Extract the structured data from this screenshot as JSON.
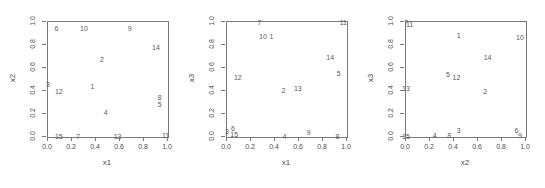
{
  "figure": {
    "type": "scatterplot-matrix-row",
    "panel_count": 3,
    "axis_ticks": [
      "0.0",
      "0.2",
      "0.4",
      "0.6",
      "0.8",
      "1.0"
    ],
    "tick_values": [
      0.0,
      0.2,
      0.4,
      0.6,
      0.8,
      1.0
    ],
    "point_color": "#595959",
    "frame_color": "#7a7a7a",
    "background": "#ffffff"
  },
  "chart_data": [
    {
      "type": "scatter",
      "title": "",
      "xlabel": "x1",
      "ylabel": "x2",
      "xlim": [
        0,
        1
      ],
      "ylim": [
        0,
        1
      ],
      "grid": false,
      "legend": "none",
      "marker": "text-labels",
      "xticks": [
        0.0,
        0.2,
        0.4,
        0.6,
        0.8,
        1.0
      ],
      "yticks": [
        0.0,
        0.2,
        0.4,
        0.6,
        0.8,
        1.0
      ],
      "xticklabels": [
        "0.0",
        "0.2",
        "0.4",
        "0.6",
        "0.8",
        "1.0"
      ],
      "yticklabels": [
        "0.0",
        "0.2",
        "0.4",
        "0.6",
        "0.8",
        "1.0"
      ],
      "points": [
        {
          "label": "1",
          "x": 0.37,
          "y": 0.44
        },
        {
          "label": "2",
          "x": 0.45,
          "y": 0.68
        },
        {
          "label": "3",
          "x": 0.0,
          "y": 0.46
        },
        {
          "label": "4",
          "x": 0.48,
          "y": 0.22
        },
        {
          "label": "5",
          "x": 0.93,
          "y": 0.29
        },
        {
          "label": "6",
          "x": 0.07,
          "y": 0.95
        },
        {
          "label": "7",
          "x": 0.25,
          "y": 0.01
        },
        {
          "label": "8",
          "x": 0.93,
          "y": 0.35
        },
        {
          "label": "9",
          "x": 0.68,
          "y": 0.95
        },
        {
          "label": "10",
          "x": 0.3,
          "y": 0.95
        },
        {
          "label": "11",
          "x": 0.98,
          "y": 0.02
        },
        {
          "label": "12",
          "x": 0.09,
          "y": 0.4
        },
        {
          "label": "13",
          "x": 0.58,
          "y": 0.01
        },
        {
          "label": "14",
          "x": 0.9,
          "y": 0.78
        },
        {
          "label": "15",
          "x": 0.09,
          "y": 0.01
        }
      ]
    },
    {
      "type": "scatter",
      "title": "",
      "xlabel": "x1",
      "ylabel": "x3",
      "xlim": [
        0,
        1
      ],
      "ylim": [
        0,
        1
      ],
      "grid": false,
      "legend": "none",
      "marker": "text-labels",
      "xticks": [
        0.0,
        0.2,
        0.4,
        0.6,
        0.8,
        1.0
      ],
      "yticks": [
        0.0,
        0.2,
        0.4,
        0.6,
        0.8,
        1.0
      ],
      "xticklabels": [
        "0.0",
        "0.2",
        "0.4",
        "0.6",
        "0.8",
        "1.0"
      ],
      "yticklabels": [
        "0.0",
        "0.2",
        "0.4",
        "0.6",
        "0.8",
        "1.0"
      ],
      "points": [
        {
          "label": "1",
          "x": 0.37,
          "y": 0.88
        },
        {
          "label": "2",
          "x": 0.47,
          "y": 0.41
        },
        {
          "label": "3",
          "x": 0.0,
          "y": 0.05
        },
        {
          "label": "4",
          "x": 0.48,
          "y": 0.01
        },
        {
          "label": "5",
          "x": 0.93,
          "y": 0.56
        },
        {
          "label": "6",
          "x": 0.05,
          "y": 0.08
        },
        {
          "label": "7",
          "x": 0.27,
          "y": 1.0
        },
        {
          "label": "8",
          "x": 0.92,
          "y": 0.01
        },
        {
          "label": "9",
          "x": 0.68,
          "y": 0.04
        },
        {
          "label": "10",
          "x": 0.3,
          "y": 0.88
        },
        {
          "label": "11",
          "x": 0.97,
          "y": 1.0
        },
        {
          "label": "12",
          "x": 0.09,
          "y": 0.52
        },
        {
          "label": "13",
          "x": 0.59,
          "y": 0.43
        },
        {
          "label": "14",
          "x": 0.86,
          "y": 0.7
        },
        {
          "label": "15",
          "x": 0.06,
          "y": 0.03
        }
      ]
    },
    {
      "type": "scatter",
      "title": "",
      "xlabel": "x2",
      "ylabel": "x3",
      "xlim": [
        0,
        1
      ],
      "ylim": [
        0,
        1
      ],
      "grid": false,
      "legend": "none",
      "marker": "text-labels",
      "xticks": [
        0.0,
        0.2,
        0.4,
        0.6,
        0.8,
        1.0
      ],
      "yticks": [
        0.0,
        0.2,
        0.4,
        0.6,
        0.8,
        1.0
      ],
      "xticklabels": [
        "0.0",
        "0.2",
        "0.4",
        "0.6",
        "0.8",
        "1.0"
      ],
      "yticklabels": [
        "0.0",
        "0.2",
        "0.4",
        "0.6",
        "0.8",
        "1.0"
      ],
      "points": [
        {
          "label": "1",
          "x": 0.44,
          "y": 0.89
        },
        {
          "label": "2",
          "x": 0.66,
          "y": 0.4
        },
        {
          "label": "3",
          "x": 0.44,
          "y": 0.06
        },
        {
          "label": "4",
          "x": 0.24,
          "y": 0.02
        },
        {
          "label": "5",
          "x": 0.35,
          "y": 0.55
        },
        {
          "label": "6",
          "x": 0.92,
          "y": 0.06
        },
        {
          "label": "7",
          "x": 0.0,
          "y": 1.0
        },
        {
          "label": "8",
          "x": 0.36,
          "y": 0.02
        },
        {
          "label": "9",
          "x": 0.95,
          "y": 0.02
        },
        {
          "label": "10",
          "x": 0.95,
          "y": 0.87
        },
        {
          "label": "11",
          "x": 0.03,
          "y": 0.98
        },
        {
          "label": "12",
          "x": 0.42,
          "y": 0.52
        },
        {
          "label": "13",
          "x": 0.0,
          "y": 0.43
        },
        {
          "label": "14",
          "x": 0.68,
          "y": 0.7
        },
        {
          "label": "15",
          "x": 0.0,
          "y": 0.01
        }
      ]
    }
  ]
}
